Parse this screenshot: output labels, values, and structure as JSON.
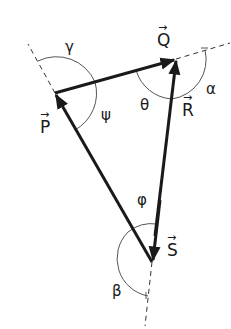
{
  "diagram": {
    "title": "",
    "vectors": [
      {
        "name": "P",
        "label": "P",
        "from": [
          138,
          248
        ],
        "to": [
          55,
          93
        ]
      },
      {
        "name": "Q",
        "label": "Q",
        "from": [
          55,
          93
        ],
        "to": [
          176,
          59
        ]
      },
      {
        "name": "R",
        "label": "R",
        "from": [
          152,
          262
        ],
        "to": [
          176,
          59
        ]
      },
      {
        "name": "S",
        "label": "S",
        "from": [
          176,
          59
        ],
        "to": [
          152,
          262
        ]
      }
    ],
    "angles": [
      {
        "name": "gamma",
        "label": "γ"
      },
      {
        "name": "psi",
        "label": "ψ"
      },
      {
        "name": "theta",
        "label": "θ"
      },
      {
        "name": "alpha",
        "label": "α"
      },
      {
        "name": "phi",
        "label": "φ"
      },
      {
        "name": "beta",
        "label": "β"
      }
    ],
    "arrow_mark": "→",
    "colors": {
      "line": "#1a1a1a",
      "arc": "#555555",
      "dash": "#333333"
    }
  }
}
